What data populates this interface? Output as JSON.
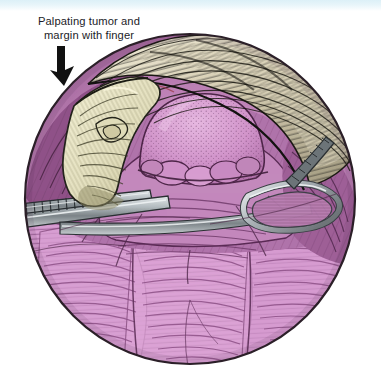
{
  "page": {
    "background_color": "#ffffff",
    "top_band_color": "#dcf0f7",
    "width": 381,
    "height": 388
  },
  "annotation": {
    "label_text": "Palpating tumor and\nmargin with finger",
    "label_color": "#1c1c28",
    "arrow_name": "down-right-arrow",
    "arrow_color": "#111111",
    "points_to": "gloved-finger"
  },
  "illustration": {
    "type": "surgical-operative-field",
    "view": "circular-aperture",
    "circle": {
      "cx": 190,
      "cy": 199,
      "r": 166,
      "outline_color": "#2b1f28"
    },
    "palette": {
      "tissue_deep_magenta": "#9c5c93",
      "tissue_mid_magenta": "#b174ac",
      "tissue_light_pink": "#d79bd0",
      "tissue_pale_pink": "#e2afdc",
      "tumor_pink": "#d79fd2",
      "fascia_tan": "#c9bfa6",
      "fascia_light": "#e3dcc6",
      "glove_cream": "#e9e6c8",
      "glove_shadow": "#cfc9a4",
      "metal_gray": "#9aa1a6",
      "metal_light": "#d4d8da",
      "metal_dark": "#5d6468",
      "ink": "#241a22"
    },
    "elements": [
      {
        "name": "gloved-finger",
        "label": "Surgeon's gloved index finger palpating the lesion",
        "region": "upper-left"
      },
      {
        "name": "tumor-mass",
        "label": "Stippled dome-shaped tumor",
        "region": "center"
      },
      {
        "name": "tumor-margin",
        "label": "Palpated margin around tumor",
        "region": "center"
      },
      {
        "name": "retractor-ring",
        "label": "Metal retractor ring / loop",
        "region": "right"
      },
      {
        "name": "instrument-shaft",
        "label": "Metal instrument shaft / retractor blade",
        "region": "left"
      },
      {
        "name": "fascia-flap",
        "label": "Retracted fascia and skin flap",
        "region": "top"
      },
      {
        "name": "muscle-bed",
        "label": "Striated muscle bed with hatching",
        "region": "bottom"
      }
    ]
  }
}
